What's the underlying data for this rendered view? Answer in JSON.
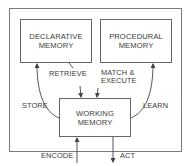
{
  "diagram": {
    "boxes": {
      "declarative": {
        "line1": "DECLARATIVE",
        "line2": "MEMORY"
      },
      "procedural": {
        "line1": "PROCEDURAL",
        "line2": "MEMORY"
      },
      "working": {
        "line1": "WORKING",
        "line2": "MEMORY"
      }
    },
    "edges": {
      "retrieve": "RETRIEVE",
      "match_execute_line1": "MATCH &",
      "match_execute_line2": "EXECUTE",
      "store": "STORE",
      "learn": "LEARN",
      "encode": "ENCODE",
      "act": "ACT"
    },
    "colors": {
      "line": "#555555",
      "frame": "#7a7a7a",
      "text": "#3a3a3a"
    }
  }
}
